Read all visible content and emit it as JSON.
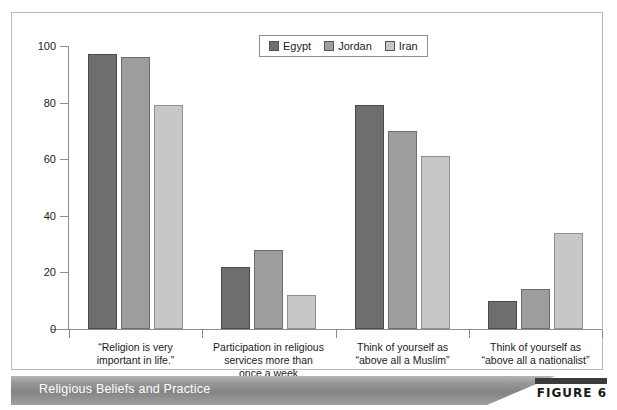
{
  "figure": {
    "caption": "Religious Beliefs and Practice",
    "figure_tag": "FIGURE 6"
  },
  "legend": {
    "position": "top-center",
    "entries": [
      {
        "label": "Egypt",
        "color": "#6e6e6e"
      },
      {
        "label": "Jordan",
        "color": "#9d9d9d"
      },
      {
        "label": "Iran",
        "color": "#c7c7c7"
      }
    ]
  },
  "axis": {
    "y_ticks": [
      "0",
      "20",
      "40",
      "60",
      "80",
      "100"
    ]
  },
  "chart_data": {
    "type": "bar",
    "title": "Religious Beliefs and Practice",
    "xlabel": "",
    "ylabel": "",
    "ylim": [
      0,
      100
    ],
    "yticks": [
      0,
      20,
      40,
      60,
      80,
      100
    ],
    "grid": false,
    "legend_position": "top-center",
    "categories": [
      "“Religion is very\nimportant in life.”",
      "Participation in religious\nservices more than\nonce a week",
      "Think of yourself as\n“above all a Muslim”",
      "Think of yourself as\n“above all a nationalist”"
    ],
    "category_lines": [
      [
        "“Religion is very",
        "important in life.”"
      ],
      [
        "Participation in religious",
        "services more than",
        "once a week"
      ],
      [
        "Think of yourself as",
        "“above all a Muslim”"
      ],
      [
        "Think of yourself as",
        "“above all a nationalist”"
      ]
    ],
    "series": [
      {
        "name": "Egypt",
        "color": "#6e6e6e",
        "values": [
          97,
          22,
          79,
          10
        ]
      },
      {
        "name": "Jordan",
        "color": "#9d9d9d",
        "values": [
          96,
          28,
          70,
          14
        ]
      },
      {
        "name": "Iran",
        "color": "#c7c7c7",
        "values": [
          79,
          12,
          61,
          34
        ]
      }
    ]
  }
}
